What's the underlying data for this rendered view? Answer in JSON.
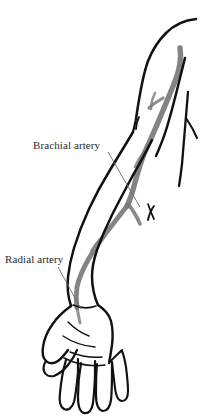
{
  "figure": {
    "type": "anatomical-line-illustration",
    "background_color": "#ffffff",
    "outline_color": "#111111",
    "artery_color": "#7a7a7a",
    "leader_line_color": "#6b6b6b",
    "text_color": "#2b2b2b"
  },
  "labels": {
    "brachial": {
      "text": "Brachial artery",
      "x": 33,
      "y": 139
    },
    "radial": {
      "text": "Radial artery",
      "x": 5,
      "y": 253
    }
  },
  "leader_lines": [
    {
      "name": "brachial-leader",
      "from_x": 108,
      "from_y": 152,
      "to_x": 140,
      "to_y": 207
    },
    {
      "name": "radial-leader",
      "from_x": 58,
      "from_y": 267,
      "to_x": 81,
      "to_y": 309
    }
  ],
  "structures": [
    {
      "name": "upper-arm",
      "label": "Brachial artery"
    },
    {
      "name": "forearm",
      "label": "Radial artery"
    },
    {
      "name": "hand",
      "label": "Hand"
    }
  ]
}
